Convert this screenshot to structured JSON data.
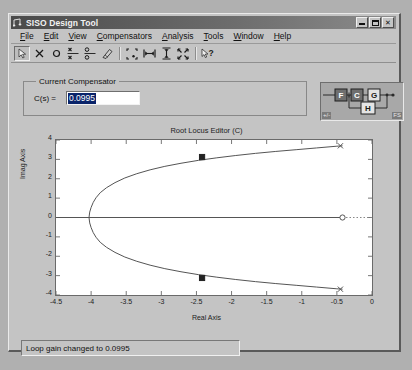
{
  "window": {
    "title": "SISO Design Tool",
    "icon": "matlab-note-icon",
    "controls": [
      {
        "name": "minimize-button",
        "label": "_"
      },
      {
        "name": "maximize-button",
        "label": "□"
      },
      {
        "name": "close-button",
        "label": "×"
      }
    ]
  },
  "menubar": {
    "items": [
      {
        "label": "File",
        "accel": "F"
      },
      {
        "label": "Edit",
        "accel": "E"
      },
      {
        "label": "View",
        "accel": "V"
      },
      {
        "label": "Compensators",
        "accel": "C"
      },
      {
        "label": "Analysis",
        "accel": "A"
      },
      {
        "label": "Tools",
        "accel": "T"
      },
      {
        "label": "Window",
        "accel": "W"
      },
      {
        "label": "Help",
        "accel": "H"
      }
    ]
  },
  "toolbar": {
    "buttons": [
      {
        "name": "pointer-arrow-icon",
        "tooltip": "Select",
        "pressed": true
      },
      {
        "name": "add-pole-x-icon",
        "tooltip": "Add real pole"
      },
      {
        "name": "add-zero-circle-icon",
        "tooltip": "Add real zero"
      },
      {
        "name": "complex-pole-pair-icon",
        "tooltip": "Add complex pole pair"
      },
      {
        "name": "complex-zero-pair-icon",
        "tooltip": "Add complex zero pair"
      },
      {
        "name": "delete-eraser-icon",
        "tooltip": "Delete pole/zero"
      },
      {
        "name": "zoom-box-icon",
        "tooltip": "Zoom in region"
      },
      {
        "name": "zoom-x-icon",
        "tooltip": "Zoom in X"
      },
      {
        "name": "zoom-y-icon",
        "tooltip": "Zoom in Y"
      },
      {
        "name": "zoom-out-icon",
        "tooltip": "Zoom out"
      },
      {
        "name": "help-pointer-icon",
        "tooltip": "What's this help"
      }
    ]
  },
  "compensator": {
    "group_title": "Current Compensator",
    "cs_label": "C(s) =",
    "value": "0.0995",
    "placeholder": "0"
  },
  "block_diagram": {
    "blocks": [
      "F",
      "C",
      "G",
      "H"
    ],
    "sign_label": "+/-",
    "fs_label": "FS"
  },
  "status": {
    "message": "Loop gain changed to 0.0995"
  },
  "chart_data": {
    "type": "line",
    "title": "Root Locus Editor (C)",
    "xlabel": "Real Axis",
    "ylabel": "Imag Axis",
    "xlim": [
      -4.5,
      0
    ],
    "ylim": [
      -4,
      4
    ],
    "xticks": [
      -4.5,
      -4,
      -3.5,
      -3,
      -2.5,
      -2,
      -1.5,
      -1,
      -0.5,
      0
    ],
    "xticklabels": [
      "-4.5",
      "-4",
      "-3.5",
      "-3",
      "-2.5",
      "-2",
      "-1.5",
      "-1",
      "-0.5",
      "0"
    ],
    "yticks": [
      4,
      3,
      2,
      1,
      0,
      -1,
      -2,
      -3,
      -4
    ],
    "yticklabels": [
      "4",
      "3",
      "2",
      "1",
      "0",
      "-1",
      "-2",
      "-3",
      "-4"
    ],
    "grid": false,
    "legend": null,
    "series": [
      {
        "name": "locus-upper-branch",
        "color": "#555555",
        "x": [
          -4.03,
          -4.02,
          -4.0,
          -3.97,
          -3.93,
          -3.87,
          -3.78,
          -3.66,
          -3.52,
          -3.35,
          -3.16,
          -2.95,
          -2.72,
          -2.47,
          -2.21,
          -1.94,
          -1.66,
          -1.37,
          -1.08,
          -0.79,
          -0.5,
          -0.42
        ],
        "y": [
          0.0,
          0.28,
          0.52,
          0.78,
          1.02,
          1.28,
          1.54,
          1.8,
          2.04,
          2.26,
          2.46,
          2.64,
          2.8,
          2.95,
          3.08,
          3.2,
          3.31,
          3.41,
          3.5,
          3.59,
          3.68,
          3.7
        ]
      },
      {
        "name": "locus-lower-branch",
        "color": "#555555",
        "x": [
          -4.03,
          -4.02,
          -4.0,
          -3.97,
          -3.93,
          -3.87,
          -3.78,
          -3.66,
          -3.52,
          -3.35,
          -3.16,
          -2.95,
          -2.72,
          -2.47,
          -2.21,
          -1.94,
          -1.66,
          -1.37,
          -1.08,
          -0.79,
          -0.5,
          -0.42
        ],
        "y": [
          0.0,
          -0.28,
          -0.52,
          -0.78,
          -1.02,
          -1.28,
          -1.54,
          -1.8,
          -2.04,
          -2.26,
          -2.46,
          -2.64,
          -2.8,
          -2.95,
          -3.08,
          -3.2,
          -3.31,
          -3.41,
          -3.5,
          -3.59,
          -3.68,
          -3.7
        ]
      },
      {
        "name": "locus-real-axis-segment",
        "color": "#555555",
        "x": [
          -4.5,
          -0.42
        ],
        "y": [
          0,
          0
        ]
      },
      {
        "name": "locus-asymptote-dotted",
        "color": "#888888",
        "style": "dotted",
        "x": [
          -0.42,
          0
        ],
        "y": [
          0,
          0
        ]
      }
    ],
    "markers": [
      {
        "name": "gain-marker-upper",
        "shape": "square",
        "x": -2.42,
        "y": 3.12,
        "color": "#222222"
      },
      {
        "name": "gain-marker-lower",
        "shape": "square",
        "x": -2.42,
        "y": -3.12,
        "color": "#222222"
      },
      {
        "name": "zero-open-circle",
        "shape": "circle-open",
        "x": -0.42,
        "y": 0,
        "color": "#555555"
      },
      {
        "name": "endpoint-cross-upper",
        "shape": "cross",
        "x": -0.45,
        "y": 3.7,
        "color": "#555555"
      },
      {
        "name": "endpoint-cross-lower",
        "shape": "cross",
        "x": -0.45,
        "y": -3.7,
        "color": "#555555"
      }
    ]
  }
}
